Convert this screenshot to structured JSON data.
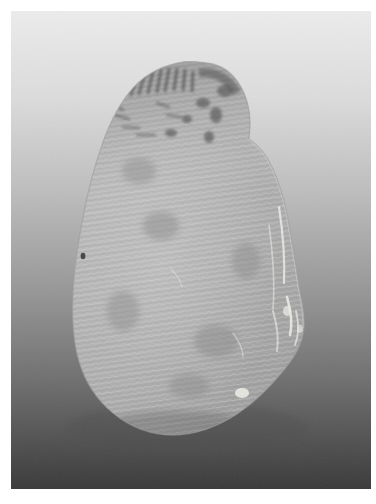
{
  "page": {
    "width": 376,
    "height": 504,
    "background_color": "#ffffff",
    "margin_px": 11
  },
  "photo": {
    "frame": {
      "x": 11,
      "y": 11,
      "width": 360,
      "height": 478
    },
    "media": "grayscale-photograph",
    "subject_name": "tuber",
    "subject_description": "single oval tuber with ridged surface texture",
    "orientation": "portrait",
    "background": {
      "type": "vertical-gradient",
      "description": "smooth studio backdrop, light at top fading to dark at bottom",
      "stops": [
        {
          "offset": "0%",
          "color": "#ececec"
        },
        {
          "offset": "18%",
          "color": "#dcdcdc"
        },
        {
          "offset": "38%",
          "color": "#bdbdbd"
        },
        {
          "offset": "58%",
          "color": "#989898"
        },
        {
          "offset": "78%",
          "color": "#6e6e6e"
        },
        {
          "offset": "100%",
          "color": "#3a3a3a"
        }
      ]
    },
    "subject": {
      "body_fill_stops": [
        {
          "offset": "0%",
          "color": "#b9b9b9"
        },
        {
          "offset": "30%",
          "color": "#b2b2b2"
        },
        {
          "offset": "62%",
          "color": "#a6a6a6"
        },
        {
          "offset": "88%",
          "color": "#979797"
        },
        {
          "offset": "100%",
          "color": "#8d8d8d"
        }
      ],
      "outline_path": "M 196 52 C 214 54 226 66 233 82 C 240 98 240 114 238 128 C 247 134 256 144 262 158 C 270 176 276 198 279 220 C 283 243 286 262 288 276 C 291 292 294 304 293 317 C 292 332 284 346 272 360 C 259 376 244 391 226 403 C 206 416 184 424 162 424 C 140 424 119 416 102 402 C 86 389 74 371 68 350 C 62 330 61 307 62 283 C 63 258 67 232 72 206 C 77 179 84 154 92 131 C 100 109 110 90 123 76 C 136 62 153 54 172 51 C 180 50 189 51 196 52 Z",
      "ridge_texture": {
        "description": "fine parallel wavy ridges running across the surface, slightly tilted",
        "spacing_px": 5,
        "angle_deg": -8,
        "light_color": "#c6c6c6",
        "dark_color": "#9b9b9b"
      },
      "dark_markings": {
        "description": "cluster of dark diagonal hatch marks and speckles on the upper-left shoulder",
        "color": "#4a4a4a",
        "region": {
          "x": 104,
          "y": 62,
          "width": 110,
          "height": 80
        }
      },
      "eye_spot": {
        "description": "small dark eye on the left edge",
        "cx": 72,
        "cy": 245,
        "r": 2.4,
        "color": "#3b3b3b"
      },
      "specular_highlights": {
        "description": "bright narrow specular streaks along the lower-right flank",
        "color": "#ecece6"
      },
      "blemishes": {
        "description": "soft darker mottled patches on the lower body",
        "color": "#8a8a8a"
      }
    }
  }
}
